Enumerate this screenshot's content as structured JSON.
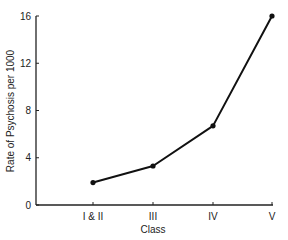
{
  "chart_data": {
    "type": "line",
    "title": "",
    "xlabel": "Class",
    "ylabel": "Rate of Psychosis per 1000",
    "categories": [
      "I & II",
      "III",
      "IV",
      "V"
    ],
    "series": [
      {
        "name": "Rate of Psychosis",
        "values": [
          1.9,
          3.3,
          6.7,
          16.0
        ]
      }
    ],
    "ylim": [
      0,
      16
    ],
    "yticks": [
      "0",
      "4",
      "8",
      "12",
      "16"
    ],
    "grid": false,
    "legend": "none",
    "markers": true,
    "line_color": "#111111"
  }
}
